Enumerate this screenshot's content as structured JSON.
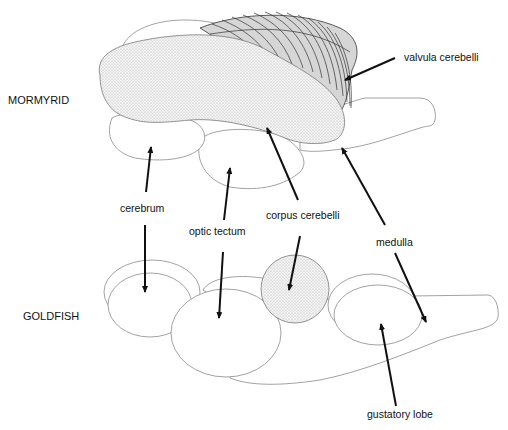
{
  "diagram": {
    "species": {
      "top": "MORMYRID",
      "bottom": "GOLDFISH"
    },
    "labels": {
      "valvula": "valvula cerebelli",
      "cerebrum": "cerebrum",
      "optic_tectum": "optic tectum",
      "corpus": "corpus cerebelli",
      "medulla": "medulla",
      "gustatory": "gustatory lobe"
    },
    "colors": {
      "stroke": "#8a8a8a",
      "arrow": "#111111",
      "valvula_fill": "#d6d6d6",
      "stipple": "#bbbbbb"
    }
  }
}
